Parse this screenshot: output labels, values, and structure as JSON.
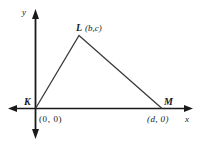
{
  "diagram": {
    "type": "coordinate-triangle",
    "axes": {
      "x_label": "x",
      "y_label": "y"
    },
    "vertices": [
      {
        "name": "K",
        "coords": "(0, 0)"
      },
      {
        "name": "L",
        "coords": "(b,c)"
      },
      {
        "name": "M",
        "coords": "(d, 0)"
      }
    ],
    "colors": {
      "axis": "#1a1a1a",
      "triangle": "#3a3a3a"
    }
  }
}
